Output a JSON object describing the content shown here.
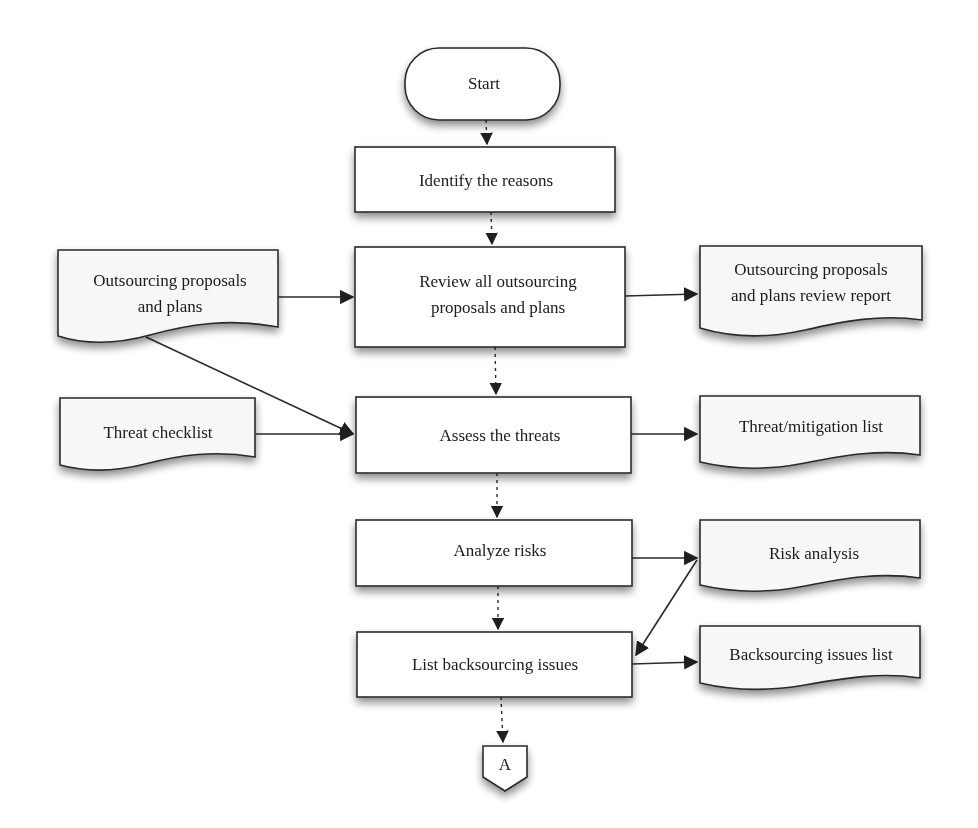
{
  "diagram": {
    "type": "flowchart",
    "nodes": {
      "start": {
        "shape": "terminator",
        "lines": [
          "Start"
        ]
      },
      "identify": {
        "shape": "process",
        "lines": [
          "Identify the reasons"
        ]
      },
      "review": {
        "shape": "process",
        "lines": [
          "Review all outsourcing",
          "proposals and plans"
        ]
      },
      "assess": {
        "shape": "process",
        "lines": [
          "Assess the threats"
        ]
      },
      "analyze": {
        "shape": "process",
        "lines": [
          "Analyze risks"
        ]
      },
      "list": {
        "shape": "process",
        "lines": [
          "List backsourcing issues"
        ]
      },
      "connector_a": {
        "shape": "off-page-connector",
        "lines": [
          "A"
        ]
      },
      "doc_proposals_in": {
        "shape": "document",
        "lines": [
          "Outsourcing proposals",
          "and plans"
        ]
      },
      "doc_threat_checklist": {
        "shape": "document",
        "lines": [
          "Threat checklist"
        ]
      },
      "doc_review_report": {
        "shape": "document",
        "lines": [
          "Outsourcing proposals",
          "and plans review report"
        ]
      },
      "doc_threat_mitigation": {
        "shape": "document",
        "lines": [
          "Threat/mitigation list"
        ]
      },
      "doc_risk_analysis": {
        "shape": "document",
        "lines": [
          "Risk analysis"
        ]
      },
      "doc_backsourcing_list": {
        "shape": "document",
        "lines": [
          "Backsourcing issues list"
        ]
      }
    },
    "edges": [
      {
        "from": "start",
        "to": "identify",
        "style": "dotted"
      },
      {
        "from": "identify",
        "to": "review",
        "style": "dotted"
      },
      {
        "from": "review",
        "to": "assess",
        "style": "dotted"
      },
      {
        "from": "assess",
        "to": "analyze",
        "style": "dotted"
      },
      {
        "from": "analyze",
        "to": "list",
        "style": "dotted"
      },
      {
        "from": "list",
        "to": "connector_a",
        "style": "dotted"
      },
      {
        "from": "doc_proposals_in",
        "to": "review",
        "style": "solid"
      },
      {
        "from": "doc_proposals_in",
        "to": "assess",
        "style": "solid"
      },
      {
        "from": "doc_threat_checklist",
        "to": "assess",
        "style": "solid"
      },
      {
        "from": "review",
        "to": "doc_review_report",
        "style": "solid"
      },
      {
        "from": "assess",
        "to": "doc_threat_mitigation",
        "style": "solid"
      },
      {
        "from": "analyze",
        "to": "doc_risk_analysis",
        "style": "solid"
      },
      {
        "from": "doc_risk_analysis",
        "to": "list",
        "style": "solid"
      },
      {
        "from": "list",
        "to": "doc_backsourcing_list",
        "style": "solid"
      }
    ]
  }
}
